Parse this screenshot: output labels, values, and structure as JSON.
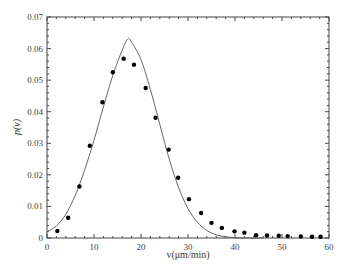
{
  "chart_data": {
    "type": "scatter",
    "title": "",
    "xlabel": "v(μm/min)",
    "ylabel": "p(v)",
    "xlim": [
      0,
      60
    ],
    "ylim": [
      0,
      0.07
    ],
    "xticks": [
      "0",
      "10",
      "20",
      "30",
      "40",
      "50",
      "60"
    ],
    "yticks": [
      "0",
      "0.01",
      "0.02",
      "0.03",
      "0.04",
      "0.05",
      "0.06",
      "0.07"
    ],
    "grid": false,
    "legend": null,
    "series": [
      {
        "name": "measured",
        "type": "scatter",
        "x": [
          2.2,
          4.5,
          6.9,
          9.1,
          11.8,
          14.0,
          16.3,
          18.5,
          21.0,
          23.1,
          25.9,
          27.9,
          30.2,
          32.8,
          35.0,
          37.2,
          39.9,
          42.0,
          44.5,
          46.8,
          49.3,
          51.2,
          54.0,
          56.4,
          58.2
        ],
        "y": [
          0.0022,
          0.0064,
          0.0163,
          0.0292,
          0.043,
          0.0525,
          0.0568,
          0.0549,
          0.0475,
          0.0381,
          0.028,
          0.0191,
          0.0123,
          0.0079,
          0.0048,
          0.0032,
          0.0021,
          0.0017,
          0.0009,
          0.0008,
          0.0007,
          0.0006,
          0.0005,
          0.0004,
          0.0004
        ]
      },
      {
        "name": "fit",
        "type": "line",
        "x": [
          0,
          2,
          4,
          6,
          8,
          10,
          12,
          14,
          16,
          17.2,
          18,
          20,
          22,
          24,
          26,
          28,
          30,
          32,
          34,
          36,
          38,
          40,
          42,
          44,
          46
        ],
        "y": [
          0.002,
          0.0038,
          0.0075,
          0.0135,
          0.0215,
          0.031,
          0.0415,
          0.0515,
          0.0595,
          0.063,
          0.062,
          0.0565,
          0.047,
          0.036,
          0.025,
          0.016,
          0.0093,
          0.005,
          0.0024,
          0.001,
          0.0004,
          0.0001,
          0.0,
          0.0,
          0.0
        ]
      }
    ],
    "colors": {
      "dots": "#000000",
      "line": "#555555",
      "axes": "#444444"
    }
  }
}
